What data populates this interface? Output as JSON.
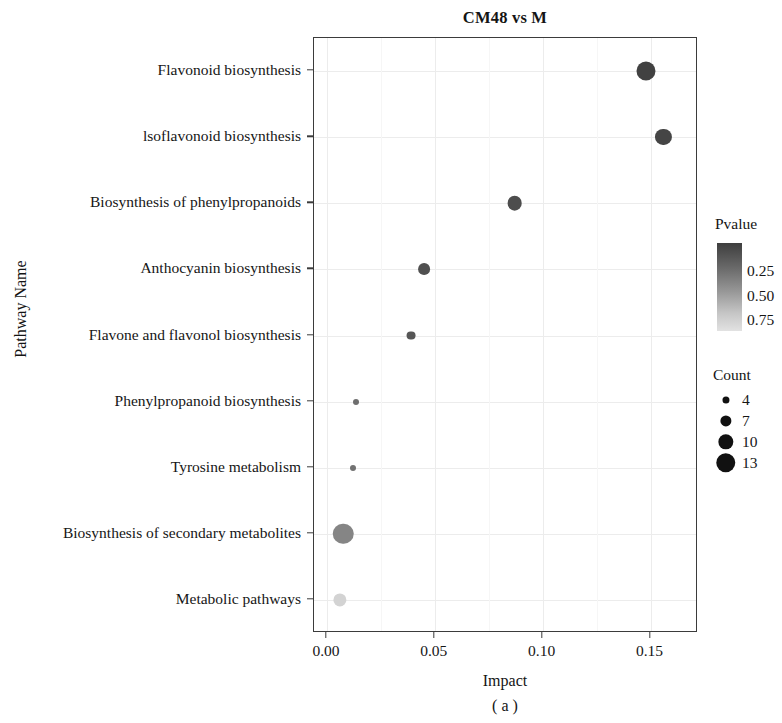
{
  "figure": {
    "title": "CM48 vs M",
    "caption": "( a )",
    "xlabel": "Impact",
    "ylabel": "Pathway Name"
  },
  "legend": {
    "pvalue_title": "Pvalue",
    "pvalue_ticks": [
      "0.25",
      "0.50",
      "0.75"
    ],
    "count_title": "Count",
    "count_items": [
      "4",
      "7",
      "10",
      "13"
    ]
  },
  "axis": {
    "xticks": [
      "0.00",
      "0.05",
      "0.10",
      "0.15"
    ]
  },
  "colors": {
    "gradient_high": "#4a4a4a",
    "gradient_low": "#e3e3e3",
    "panel_border": "#3b3b3b",
    "grid": "#ececec"
  },
  "chart_data": {
    "type": "scatter",
    "title": "CM48 vs M",
    "xlabel": "Impact",
    "ylabel": "Pathway Name",
    "xlim": [
      -0.006,
      0.172
    ],
    "xticks": [
      0.0,
      0.05,
      0.1,
      0.15
    ],
    "grid": true,
    "legend_position": "right",
    "categories": [
      "Flavonoid biosynthesis",
      "lsoflavonoid biosynthesis",
      "Biosynthesis of phenylpropanoids",
      "Anthocyanin biosynthesis",
      "Flavone and flavonol biosynthesis",
      "Phenylpropanoid biosynthesis",
      "Tyrosine metabolism",
      "Biosynthesis of secondary metabolites",
      "Metabolic pathways"
    ],
    "points": [
      {
        "pathway": "Flavonoid biosynthesis",
        "impact": 0.148,
        "count": 12,
        "pvalue": 0.04
      },
      {
        "pathway": "lsoflavonoid biosynthesis",
        "impact": 0.156,
        "count": 10,
        "pvalue": 0.06
      },
      {
        "pathway": "Biosynthesis of phenylpropanoids",
        "impact": 0.087,
        "count": 9,
        "pvalue": 0.1
      },
      {
        "pathway": "Anthocyanin biosynthesis",
        "impact": 0.045,
        "count": 7,
        "pvalue": 0.12
      },
      {
        "pathway": "Flavone and flavonol biosynthesis",
        "impact": 0.039,
        "count": 5,
        "pvalue": 0.15
      },
      {
        "pathway": "Phenylpropanoid biosynthesis",
        "impact": 0.0135,
        "count": 3,
        "pvalue": 0.28
      },
      {
        "pathway": "Tyrosine metabolism",
        "impact": 0.012,
        "count": 3,
        "pvalue": 0.3
      },
      {
        "pathway": "Biosynthesis of secondary metabolites",
        "impact": 0.0075,
        "count": 13,
        "pvalue": 0.4
      },
      {
        "pathway": "Metabolic pathways",
        "impact": 0.006,
        "count": 8,
        "pvalue": 0.82
      }
    ],
    "size_legend": {
      "label": "Count",
      "breaks": [
        4,
        7,
        10,
        13
      ]
    },
    "color_legend": {
      "label": "Pvalue",
      "breaks": [
        0.25,
        0.5,
        0.75
      ],
      "scale": "grayscale dark=low p, light=high p"
    }
  }
}
